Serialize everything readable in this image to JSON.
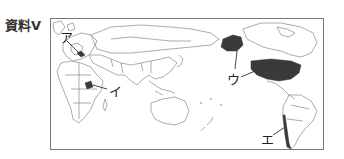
{
  "title": "資料Ⅴ",
  "map": {
    "type": "world-map",
    "projection": "Pacific-centered",
    "highlighted_color": "#3a3a3a",
    "labels": [
      {
        "id": "a",
        "text": "ア",
        "target": "Europe (Germany/Central Europe)"
      },
      {
        "id": "i",
        "text": "イ",
        "target": "East Africa (Tanzania area)"
      },
      {
        "id": "u",
        "text": "ウ",
        "target": "United States (incl. Alaska)"
      },
      {
        "id": "e",
        "text": "エ",
        "target": "Chile"
      }
    ]
  }
}
